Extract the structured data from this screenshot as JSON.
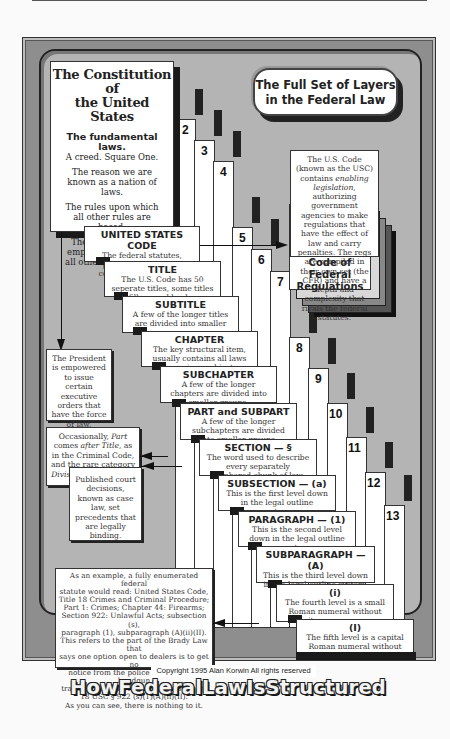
{
  "header": {
    "title_line1": "The Full Set of Layers",
    "title_line2": "in the Federal Law"
  },
  "constitution": {
    "title_line1": "The Constitution of",
    "title_line2": "the United States",
    "heading": "The fundamental laws.",
    "lines": [
      "A creed.  Square One.",
      "The reason we are known as a nation of laws.",
      "The rules upon which all other rules are based.",
      "The document that empowers and limits all other rule-making."
    ]
  },
  "levels": [
    {
      "num": "2",
      "title": "UNITED STATES CODE",
      "desc": "The federal statutes, passed by Congress, commonly called laws."
    },
    {
      "num": "3",
      "title": "TITLE",
      "desc": "The U.S. Code has 50 seperate titles, some titles fill several books."
    },
    {
      "num": "4",
      "title": "SUBTITLE",
      "desc": "A few of the longer titles are divided into smaller groups."
    },
    {
      "num": "5",
      "title": "CHAPTER",
      "desc": "The key structural item, usually contains all laws on a given subject."
    },
    {
      "num": "6",
      "title": "SUBCHAPTER",
      "desc": "A few of the longer chapters are divided into smaller groups."
    },
    {
      "num": "7",
      "title": "PART and SUBPART",
      "desc": "A few of the longer subchapters are divided into smaller groups."
    },
    {
      "num": "8",
      "title": "SECTION — §",
      "desc": "The word used to describe every separately numbered chunk of law."
    },
    {
      "num": "9",
      "title": "SUBSECTION — (a)",
      "desc": "This is the first level down in the legal outline system."
    },
    {
      "num": "10",
      "title": "PARAGRAPH — (1)",
      "desc": "This is the second level down in the legal outline system."
    },
    {
      "num": "11",
      "title": "SUBPARAGRAPH — (A)",
      "desc": "This is the third level down in the legal outline system."
    },
    {
      "num": "12",
      "title": "(i)",
      "desc": "The fourth level is a small Roman numeral without its own name."
    },
    {
      "num": "13",
      "title": "(I)",
      "desc": "The fifth level is a capital Roman numeral without its own name."
    }
  ],
  "cfr": {
    "text": "The U.S. Code (known as the USC) contains enabling legislation, authorizing government agencies to make regulations that have the effect of law and carry penalties.  The regs are compiled in their own set (the CFR) and have a depth and complexity that rivals the federal statutes.",
    "text_pre": "The U.S. Code (known as the USC) contains ",
    "text_em": "enabling legislation",
    "text_post": ", authorizing government agencies to make regulations that have the effect of law and carry penalties.  The regs are compiled in their own set (the CFR) and have a depth and complexity that rivals the federal statutes.",
    "label_line1": "Code of Federal",
    "label_line2": "Regulations"
  },
  "notes": {
    "president": "The President is empowered to issue certain executive orders that have the force of law.",
    "part_pre": "Occasionally, ",
    "part_em1": "Part",
    "part_mid1": " comes ",
    "part_em2": "after Title",
    "part_mid2": ", as in the Criminal Code, and the rare category ",
    "part_em3": "Division",
    "part_post": " is sometimes used.",
    "caselaw": "Published court decisions, known as case law, set precedents that are legally binding.",
    "example_lines": [
      "As an example, a fully enumerated federal",
      "statute would read:  United States Code,",
      "Title 18 Crimes and Criminal Procedure;",
      "Part 1: Crimes; Chapter 44: Firearms;",
      "Section 922: Unlawful Acts; subsection (s),",
      "paragraph (1), subparagraph (A)(ii)(II).",
      "This refers to the part of the Brady Law that",
      "says one option open to dealers is to get no",
      "notice from the police prohibiting a handgun",
      "transfer. The shorthand form would be:",
      "18 USC § 922 (s)(1)(A)(ii)(II).",
      "As you can see, there is nothing to it."
    ]
  },
  "footer": {
    "copyright": "Copyright 1995 Alan Korwin   All rights reserved",
    "title": "HowFederalLawIsStructured"
  },
  "colors": {
    "outer_frame": "#8e8e8e",
    "inner_panel": "#b4b4b4",
    "box_fill": "#ffffff",
    "shadow": "#1a1a1a"
  }
}
